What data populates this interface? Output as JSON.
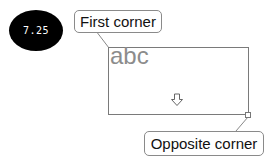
{
  "badge": {
    "value": "7.25",
    "color": "#000000"
  },
  "callouts": {
    "first": "First corner",
    "opposite": "Opposite corner"
  },
  "rectangle": {
    "sample_text": "abc",
    "arrow": "down-arrow-outline"
  },
  "colors": {
    "border": "#7a7a7a",
    "sample_text": "#8c8c8c"
  }
}
